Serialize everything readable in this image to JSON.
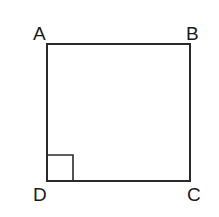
{
  "figure": {
    "shape": "square",
    "vertices": [
      {
        "label": "A",
        "x": 47,
        "y": 44
      },
      {
        "label": "B",
        "x": 190,
        "y": 44
      },
      {
        "label": "C",
        "x": 190,
        "y": 181
      },
      {
        "label": "D",
        "x": 47,
        "y": 181
      }
    ],
    "right_angle_marker": {
      "at": "D",
      "size": 26
    },
    "stroke_color": "#2a2a2a"
  }
}
